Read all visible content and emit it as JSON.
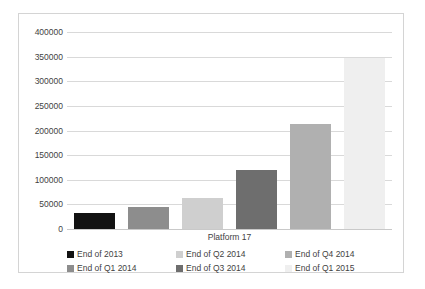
{
  "chart_data": {
    "type": "bar",
    "title": "",
    "subtitle": "",
    "xlabel": "Platform 17",
    "ylabel": "",
    "categories": [
      "Platform 17"
    ],
    "grid": true,
    "legend_position": "bottom",
    "ylim": [
      0,
      400000
    ],
    "ytick_labels": [
      "400000",
      "350000",
      "300000",
      "250000",
      "200000",
      "150000",
      "100000",
      "50000",
      "0"
    ],
    "ytick_values": [
      400000,
      350000,
      300000,
      250000,
      200000,
      150000,
      100000,
      50000,
      0
    ],
    "series": [
      {
        "name": "End of 2013",
        "values": [
          33000
        ],
        "color": "#121212"
      },
      {
        "name": "End of Q1 2014",
        "values": [
          45000
        ],
        "color": "#8d8d8d"
      },
      {
        "name": "End of Q2 2014",
        "values": [
          62000
        ],
        "color": "#cfcfcf"
      },
      {
        "name": "End of Q3 2014",
        "values": [
          120000
        ],
        "color": "#6e6e6e"
      },
      {
        "name": "End of Q4 2014",
        "values": [
          213000
        ],
        "color": "#b0b0b0"
      },
      {
        "name": "End of Q1 2015",
        "values": [
          348000
        ],
        "color": "#efefef"
      }
    ]
  },
  "legend": {
    "items": [
      {
        "label": "End of 2013",
        "color": "#121212"
      },
      {
        "label": "End of Q1 2014",
        "color": "#8d8d8d"
      },
      {
        "label": "End of Q2 2014",
        "color": "#cfcfcf"
      },
      {
        "label": "End of Q3 2014",
        "color": "#6e6e6e"
      },
      {
        "label": "End of Q4 2014",
        "color": "#b0b0b0"
      },
      {
        "label": "End of Q1 2015",
        "color": "#efefef"
      }
    ]
  }
}
